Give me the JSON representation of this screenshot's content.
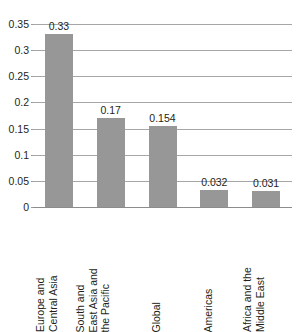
{
  "chart_data": {
    "type": "bar",
    "title": "",
    "subtitle": "",
    "xlabel": "",
    "ylabel": "",
    "categories": [
      "Europe and Central Asia",
      "South and East Asia and the Pacific",
      "Global",
      "Americas",
      "Africa and the Middle East"
    ],
    "category_lines": [
      [
        "Europe and",
        "Central Asia"
      ],
      [
        "South and",
        "East Asia and",
        "the Pacific"
      ],
      [
        "Global"
      ],
      [
        "Americas"
      ],
      [
        "Africa and the",
        "Middle East"
      ]
    ],
    "values": [
      0.33,
      0.17,
      0.154,
      0.032,
      0.031
    ],
    "value_labels": [
      "0.33",
      "0.17",
      "0.154",
      "0.032",
      "0.031"
    ],
    "ylim": [
      0,
      0.35
    ],
    "ytick_values": [
      0,
      0.05,
      0.1,
      0.15,
      0.2,
      0.25,
      0.3,
      0.35
    ],
    "ytick_labels": [
      "0",
      "0.05",
      "0.1",
      "0.15",
      "0.2",
      "0.25",
      "0.3",
      "0.35"
    ],
    "grid": true,
    "grid_axis": "y",
    "legend": false,
    "legend_position": "none",
    "bar_color": "#979797",
    "gridline_color": "#a6a6a6",
    "text_color": "#231f20",
    "background_color": "#ffffff",
    "label_rotation": 90
  }
}
